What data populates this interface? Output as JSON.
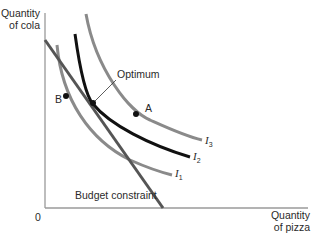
{
  "diagram": {
    "axes": {
      "y_label_line1": "Quantity",
      "y_label_line2": "of cola",
      "x_label_line1": "Quantity",
      "x_label_line2": "of pizza",
      "origin": "0"
    },
    "curves": {
      "i1": {
        "letter": "I",
        "sub": "1",
        "color": "#8a8a8a"
      },
      "i2": {
        "letter": "I",
        "sub": "2",
        "color": "#111111"
      },
      "i3": {
        "letter": "I",
        "sub": "3",
        "color": "#8a8a8a"
      }
    },
    "budget": {
      "label": "Budget constraint",
      "color": "#555555"
    },
    "points": {
      "optimum": "Optimum",
      "a": "A",
      "b": "B"
    }
  }
}
